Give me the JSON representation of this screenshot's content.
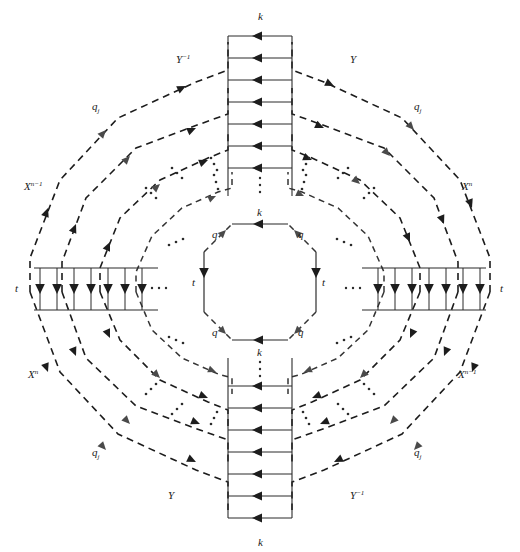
{
  "figure": {
    "width": 520,
    "height": 552,
    "background": "#ffffff",
    "ink_color": "#1d1d1d",
    "grey_arrow_color": "#4a4a4a"
  },
  "labels": {
    "k": "k",
    "t": "t",
    "q": "q",
    "q_j_base": "q",
    "q_j_sub": "j",
    "Y": "Y",
    "Y_inv_base": "Y",
    "Y_inv_sup": "−1",
    "X_n_base": "X",
    "X_n_sup": "n",
    "X_nm1_base": "X",
    "X_nm1_sup": "n−1"
  },
  "rings": [
    {
      "name": "inner-octagon",
      "radius": 62,
      "style": "mixed",
      "edge_labels": {
        "top": "k",
        "bottom": "k",
        "left": "t",
        "right": "t",
        "diagonals": "q"
      }
    },
    {
      "name": "ring-2",
      "radius": 118,
      "style": "mixed",
      "edge_labels": {
        "top": "k",
        "bottom": "k",
        "left": "t",
        "right": "t"
      }
    },
    {
      "name": "ring-3",
      "radius": 160,
      "style": "mixed",
      "edge_labels": {
        "top": "k",
        "bottom": "k",
        "left": "t",
        "right": "t"
      }
    },
    {
      "name": "ring-4",
      "radius": 200,
      "style": "mixed",
      "edge_labels": {
        "top": "k",
        "bottom": "k",
        "left": "t",
        "right": "t"
      }
    },
    {
      "name": "ring-5-outer",
      "radius": 238,
      "style": "mixed",
      "edge_labels": {
        "top": "k",
        "bottom": "k",
        "left": "t",
        "right": "t"
      }
    }
  ],
  "ladders": {
    "top": {
      "name": "top-ladder",
      "rung_label": "k",
      "rung_count": 8,
      "arrow_direction": "left",
      "label_position": "above"
    },
    "bottom": {
      "name": "bottom-ladder",
      "rung_label": "k",
      "rung_count": 8,
      "arrow_direction": "left",
      "label_position": "below"
    },
    "left": {
      "name": "left-ladder",
      "rung_label": "t",
      "rung_count": 7,
      "arrow_direction": "down",
      "label_position": "left"
    },
    "right": {
      "name": "right-ladder",
      "rung_label": "t",
      "rung_count": 7,
      "arrow_direction": "down",
      "label_position": "right"
    }
  },
  "corner_labels": [
    {
      "name": "label-y-inverse-top-left",
      "text": "Y",
      "sup": "−1",
      "x": 183,
      "y": 63
    },
    {
      "name": "label-y-top-right",
      "text": "Y",
      "sup": "",
      "x": 352,
      "y": 63
    },
    {
      "name": "label-qj-top-left",
      "text": "q",
      "sub": "j",
      "x": 98,
      "y": 108
    },
    {
      "name": "label-qj-top-right",
      "text": "q",
      "sub": "j",
      "x": 418,
      "y": 108
    },
    {
      "name": "label-x-nm1-left",
      "text": "X",
      "sup": "n−1",
      "x": 28,
      "y": 188
    },
    {
      "name": "label-x-n-right",
      "text": "X",
      "sup": "n",
      "x": 464,
      "y": 188
    },
    {
      "name": "label-x-n-bottom-left",
      "text": "X",
      "sup": "n",
      "x": 30,
      "y": 375
    },
    {
      "name": "label-x-nm1-bottom-right",
      "text": "X",
      "sup": "n−1",
      "x": 462,
      "y": 375
    },
    {
      "name": "label-qj-bottom-left",
      "text": "q",
      "sub": "j",
      "x": 98,
      "y": 452
    },
    {
      "name": "label-qj-bottom-right",
      "text": "q",
      "sub": "j",
      "x": 418,
      "y": 452
    },
    {
      "name": "label-y-bottom-left",
      "text": "Y",
      "sup": "",
      "x": 172,
      "y": 496
    },
    {
      "name": "label-y-inverse-bottom-right",
      "text": "Y",
      "sup": "−1",
      "x": 355,
      "y": 496
    }
  ],
  "edge_labels": [
    {
      "name": "label-k-top-outer",
      "text": "k",
      "x": 262,
      "y": 16
    },
    {
      "name": "label-k-bottom-outer",
      "text": "k",
      "x": 262,
      "y": 540
    },
    {
      "name": "label-t-left-outer",
      "text": "t",
      "x": 14,
      "y": 284
    },
    {
      "name": "label-t-right-outer",
      "text": "t",
      "x": 503,
      "y": 284
    },
    {
      "name": "label-k-top-inner",
      "text": "k",
      "x": 262,
      "y": 213
    },
    {
      "name": "label-k-bottom-inner",
      "text": "k",
      "x": 262,
      "y": 348
    },
    {
      "name": "label-t-left-inner",
      "text": "t",
      "x": 195,
      "y": 284
    },
    {
      "name": "label-t-right-inner",
      "text": "t",
      "x": 326,
      "y": 284
    },
    {
      "name": "label-q-inner-top-left",
      "text": "q",
      "x": 214,
      "y": 234
    },
    {
      "name": "label-q-inner-top-right",
      "text": "q",
      "x": 303,
      "y": 234
    },
    {
      "name": "label-q-inner-bottom-left",
      "text": "q",
      "x": 214,
      "y": 330
    },
    {
      "name": "label-q-inner-bottom-right",
      "text": "q",
      "x": 303,
      "y": 330
    }
  ],
  "ellipses": {
    "name": "continuation-dots",
    "description": "three-dot ellipses indicating repeated concentric rings",
    "glyph": "⋯"
  }
}
